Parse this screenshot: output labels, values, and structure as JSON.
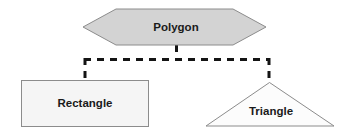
{
  "diagram": {
    "type": "uml-generalization-hierarchy",
    "background_color": "#ffffff",
    "parent": {
      "label": "Polygon",
      "shape": "hexagon",
      "fill_color": "#d3d3d3",
      "stroke_color": "#8c8c8c",
      "text_color": "#1a1a1a"
    },
    "children": [
      {
        "label": "Rectangle",
        "shape": "rectangle",
        "fill_color": "#f5f5f5",
        "stroke_color": "#8c8c8c",
        "text_color": "#1a1a1a"
      },
      {
        "label": "Triangle",
        "shape": "triangle",
        "fill_color": "#fcfcfc",
        "stroke_color": "#8c8c8c",
        "text_color": "#1a1a1a"
      }
    ],
    "connectors": {
      "style": "dashed",
      "color": "#141414",
      "width": 3,
      "dash_pattern": "7 6"
    }
  }
}
